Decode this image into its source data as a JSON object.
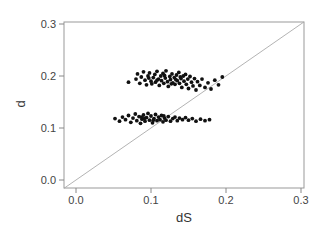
{
  "chart_data": {
    "type": "scatter",
    "title": "",
    "xlabel": "dS",
    "ylabel": "d",
    "xlim": [
      -0.016,
      0.304
    ],
    "ylim": [
      -0.015,
      0.305
    ],
    "x_ticks": [
      0.0,
      0.1,
      0.2,
      0.3
    ],
    "y_ticks": [
      0.0,
      0.1,
      0.2,
      0.3
    ],
    "x_tick_labels": [
      "0.0",
      "0.1",
      "0.2",
      "0.3"
    ],
    "y_tick_labels": [
      "0.0",
      "0.1",
      "0.2",
      "0.3"
    ],
    "grid": false,
    "reference_line": {
      "type": "identity",
      "from": [
        -0.016,
        -0.016
      ],
      "to": [
        0.304,
        0.304
      ],
      "color": "#aaaaaa"
    },
    "series": [
      {
        "name": "upper cluster",
        "color": "#111111",
        "x_range": [
          0.07,
          0.195
        ],
        "y_range": [
          0.17,
          0.21
        ],
        "center": [
          0.125,
          0.19
        ],
        "points": [
          [
            0.07,
            0.188
          ],
          [
            0.08,
            0.194
          ],
          [
            0.082,
            0.204
          ],
          [
            0.085,
            0.186
          ],
          [
            0.087,
            0.198
          ],
          [
            0.09,
            0.208
          ],
          [
            0.092,
            0.192
          ],
          [
            0.094,
            0.183
          ],
          [
            0.096,
            0.2
          ],
          [
            0.098,
            0.206
          ],
          [
            0.1,
            0.19
          ],
          [
            0.101,
            0.185
          ],
          [
            0.103,
            0.197
          ],
          [
            0.105,
            0.203
          ],
          [
            0.106,
            0.188
          ],
          [
            0.108,
            0.209
          ],
          [
            0.11,
            0.194
          ],
          [
            0.111,
            0.182
          ],
          [
            0.113,
            0.2
          ],
          [
            0.114,
            0.191
          ],
          [
            0.116,
            0.205
          ],
          [
            0.117,
            0.186
          ],
          [
            0.119,
            0.196
          ],
          [
            0.12,
            0.21
          ],
          [
            0.122,
            0.189
          ],
          [
            0.123,
            0.18
          ],
          [
            0.125,
            0.199
          ],
          [
            0.126,
            0.193
          ],
          [
            0.128,
            0.204
          ],
          [
            0.129,
            0.187
          ],
          [
            0.131,
            0.197
          ],
          [
            0.132,
            0.184
          ],
          [
            0.134,
            0.202
          ],
          [
            0.135,
            0.191
          ],
          [
            0.137,
            0.207
          ],
          [
            0.138,
            0.186
          ],
          [
            0.14,
            0.195
          ],
          [
            0.141,
            0.178
          ],
          [
            0.143,
            0.2
          ],
          [
            0.144,
            0.19
          ],
          [
            0.146,
            0.203
          ],
          [
            0.147,
            0.184
          ],
          [
            0.149,
            0.194
          ],
          [
            0.15,
            0.176
          ],
          [
            0.152,
            0.199
          ],
          [
            0.154,
            0.188
          ],
          [
            0.156,
            0.181
          ],
          [
            0.158,
            0.195
          ],
          [
            0.16,
            0.173
          ],
          [
            0.162,
            0.189
          ],
          [
            0.165,
            0.182
          ],
          [
            0.168,
            0.194
          ],
          [
            0.172,
            0.178
          ],
          [
            0.176,
            0.187
          ],
          [
            0.18,
            0.175
          ],
          [
            0.185,
            0.192
          ],
          [
            0.19,
            0.183
          ],
          [
            0.195,
            0.198
          ],
          [
            0.097,
            0.196
          ],
          [
            0.118,
            0.201
          ],
          [
            0.127,
            0.185
          ],
          [
            0.139,
            0.198
          ],
          [
            0.108,
            0.192
          ],
          [
            0.133,
            0.193
          ]
        ]
      },
      {
        "name": "lower cluster",
        "color": "#111111",
        "x_range": [
          0.052,
          0.178
        ],
        "y_range": [
          0.108,
          0.13
        ],
        "center": [
          0.11,
          0.118
        ],
        "points": [
          [
            0.052,
            0.118
          ],
          [
            0.058,
            0.113
          ],
          [
            0.062,
            0.121
          ],
          [
            0.066,
            0.116
          ],
          [
            0.07,
            0.124
          ],
          [
            0.073,
            0.111
          ],
          [
            0.076,
            0.119
          ],
          [
            0.079,
            0.127
          ],
          [
            0.081,
            0.114
          ],
          [
            0.084,
            0.122
          ],
          [
            0.086,
            0.109
          ],
          [
            0.088,
            0.117
          ],
          [
            0.09,
            0.125
          ],
          [
            0.092,
            0.113
          ],
          [
            0.094,
            0.12
          ],
          [
            0.096,
            0.128
          ],
          [
            0.098,
            0.115
          ],
          [
            0.1,
            0.123
          ],
          [
            0.102,
            0.11
          ],
          [
            0.104,
            0.118
          ],
          [
            0.106,
            0.126
          ],
          [
            0.108,
            0.114
          ],
          [
            0.11,
            0.121
          ],
          [
            0.112,
            0.116
          ],
          [
            0.114,
            0.124
          ],
          [
            0.116,
            0.112
          ],
          [
            0.118,
            0.119
          ],
          [
            0.12,
            0.115
          ],
          [
            0.123,
            0.122
          ],
          [
            0.126,
            0.113
          ],
          [
            0.129,
            0.118
          ],
          [
            0.132,
            0.121
          ],
          [
            0.135,
            0.114
          ],
          [
            0.138,
            0.119
          ],
          [
            0.142,
            0.116
          ],
          [
            0.146,
            0.12
          ],
          [
            0.15,
            0.115
          ],
          [
            0.155,
            0.118
          ],
          [
            0.16,
            0.113
          ],
          [
            0.166,
            0.117
          ],
          [
            0.172,
            0.114
          ],
          [
            0.178,
            0.116
          ],
          [
            0.091,
            0.118
          ],
          [
            0.103,
            0.115
          ],
          [
            0.117,
            0.123
          ],
          [
            0.087,
            0.121
          ]
        ]
      }
    ]
  },
  "layout": {
    "plot_frame": {
      "left": 64,
      "top": 22,
      "right": 304,
      "bottom": 188
    },
    "x_px": {
      "at0": 76,
      "per_unit": 750
    },
    "y_px": {
      "at0": 180,
      "per_unit": 520
    },
    "axis_color": "#888888",
    "frame_color": "#999999",
    "text_color": "#444444"
  }
}
